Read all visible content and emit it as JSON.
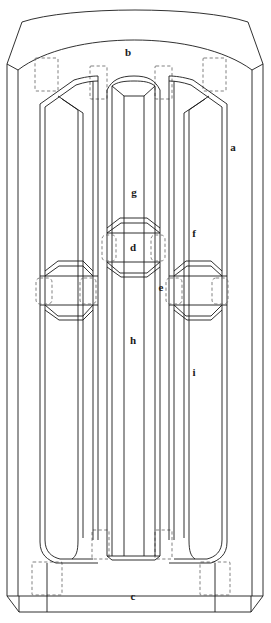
{
  "drawing": {
    "title": "Arched panel door assembly - exploded component diagram",
    "type": "technical-line-drawing",
    "width": 271,
    "height": 623,
    "line_color": "#1a1a1a",
    "hidden_line_color": "#6a6a6a",
    "background": "#ffffff",
    "fill": "none"
  },
  "labels": [
    {
      "key": "a",
      "text": "a",
      "x": 233,
      "y": 147,
      "part": "right-stile"
    },
    {
      "key": "b",
      "text": "b",
      "x": 128,
      "y": 52,
      "part": "arched-top-rail"
    },
    {
      "key": "c",
      "text": "c",
      "x": 133,
      "y": 596,
      "part": "bottom-rail"
    },
    {
      "key": "d",
      "text": "d",
      "x": 133,
      "y": 247,
      "part": "centre-short-panel"
    },
    {
      "key": "e",
      "text": "e",
      "x": 161,
      "y": 287,
      "part": "mid-rail-tenon"
    },
    {
      "key": "f",
      "text": "f",
      "x": 194,
      "y": 233,
      "part": "right-upper-panel"
    },
    {
      "key": "g",
      "text": "g",
      "x": 134,
      "y": 192,
      "part": "centre-upper-panel"
    },
    {
      "key": "h",
      "text": "h",
      "x": 133,
      "y": 340,
      "part": "centre-lower-panel"
    },
    {
      "key": "i",
      "text": "i",
      "x": 194,
      "y": 372,
      "part": "right-lower-panel"
    }
  ],
  "components": {
    "a": "Right stile (vertical side member)",
    "b": "Arched head rail",
    "c": "Bottom rail",
    "d": "Centre short panel",
    "e": "Mid rail / tenon joint",
    "f": "Right upper panel",
    "g": "Centre upper panel",
    "h": "Centre lower panel",
    "i": "Right lower panel"
  },
  "joints": {
    "style": "mortise-and-tenon",
    "representation": "dashed-rectangle",
    "count_top": 4,
    "count_bottom": 4,
    "count_mid": 6
  }
}
